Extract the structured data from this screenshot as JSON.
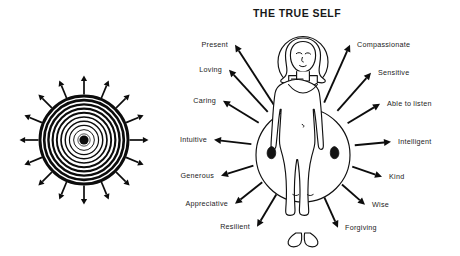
{
  "page": {
    "background_color": "#ffffff",
    "ink_color": "#111111",
    "width": 460,
    "height": 256
  },
  "title": {
    "text": "THE TRUE SELF",
    "color": "#181818"
  },
  "left_diagram": {
    "name": "radiating-concentric-circles",
    "ring_count": 10,
    "ray_count": 16,
    "center_dot": true,
    "center_x": 84,
    "center_y": 140,
    "outer_radius": 44,
    "color": "#0c0c0c"
  },
  "figure": {
    "name": "human-figure-with-aura",
    "halo": true,
    "body_aura": true,
    "center_x": 303,
    "color": "#111111"
  },
  "traits": {
    "label_color": "#232323",
    "items": [
      {
        "label": "Present",
        "side": "left",
        "x": 228,
        "y": 47,
        "anchor": "end"
      },
      {
        "label": "Loving",
        "side": "left",
        "x": 222,
        "y": 72,
        "anchor": "end"
      },
      {
        "label": "Caring",
        "side": "left",
        "x": 216,
        "y": 103,
        "anchor": "end"
      },
      {
        "label": "Intuitive",
        "side": "left",
        "x": 207,
        "y": 142,
        "anchor": "end"
      },
      {
        "label": "Generous",
        "side": "left",
        "x": 214,
        "y": 178,
        "anchor": "end"
      },
      {
        "label": "Appreciative",
        "side": "left",
        "x": 228,
        "y": 206,
        "anchor": "end"
      },
      {
        "label": "Resilient",
        "side": "left",
        "x": 250,
        "y": 229,
        "anchor": "end"
      },
      {
        "label": "Compassionate",
        "side": "right",
        "x": 357,
        "y": 47,
        "anchor": "start"
      },
      {
        "label": "Sensitive",
        "side": "right",
        "x": 378,
        "y": 75,
        "anchor": "start"
      },
      {
        "label": "Able to listen",
        "side": "right",
        "x": 387,
        "y": 106,
        "anchor": "start"
      },
      {
        "label": "Intelligent",
        "side": "right",
        "x": 398,
        "y": 144,
        "anchor": "start"
      },
      {
        "label": "Kind",
        "side": "right",
        "x": 389,
        "y": 179,
        "anchor": "start"
      },
      {
        "label": "Wise",
        "side": "right",
        "x": 372,
        "y": 207,
        "anchor": "start"
      },
      {
        "label": "Forgiving",
        "side": "right",
        "x": 345,
        "y": 230,
        "anchor": "start"
      }
    ]
  }
}
